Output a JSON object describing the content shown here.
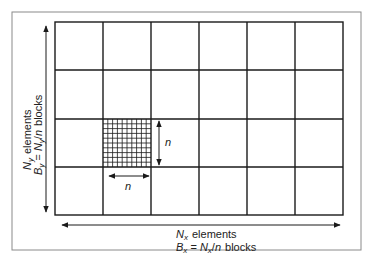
{
  "diagram": {
    "grid": {
      "cols": 6,
      "rows": 4,
      "fine_mesh": {
        "col": 1,
        "row": 2,
        "subdivisions": 10
      }
    },
    "labels": {
      "x_elements_var": "N",
      "x_elements_sub": "x",
      "x_elements_word": "elements",
      "x_blocks_var": "B",
      "x_blocks_sub": "x",
      "x_blocks_eq": " = ",
      "x_blocks_num_var": "N",
      "x_blocks_num_sub": "x",
      "x_blocks_div": "/",
      "x_blocks_n": "n",
      "x_blocks_word": "blocks",
      "y_elements_var": "N",
      "y_elements_sub": "y",
      "y_elements_word": "elements",
      "y_blocks_var": "B",
      "y_blocks_sub": "y",
      "y_blocks_eq": " = ",
      "y_blocks_num_var": "N",
      "y_blocks_num_sub": "y",
      "y_blocks_div": "/",
      "y_blocks_n": "n",
      "y_blocks_word": "blocks",
      "block_size_h": "n",
      "block_size_v": "n"
    },
    "colors": {
      "line": "#1a1a1a",
      "frame": "#8a8a8a",
      "background": "#ffffff"
    }
  }
}
